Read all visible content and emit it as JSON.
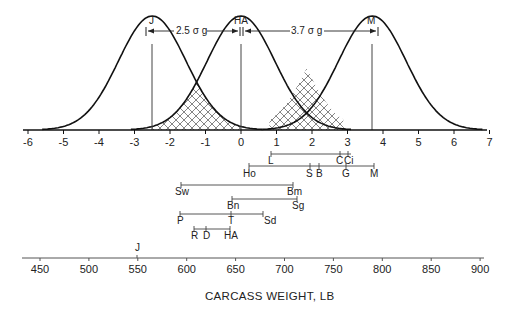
{
  "chart_data": {
    "type": "diagram",
    "title": "",
    "curves": [
      {
        "name": "J",
        "mean_sigma": -2.5,
        "label": "J"
      },
      {
        "name": "HA",
        "mean_sigma": 0,
        "label": "HA"
      },
      {
        "name": "M",
        "mean_sigma": 3.7,
        "label": "M"
      }
    ],
    "distance_annotations": [
      {
        "from": "J",
        "to": "HA",
        "label": "2.5 σ g"
      },
      {
        "from": "HA",
        "to": "M",
        "label": "3.7 σ g"
      }
    ],
    "sigma_axis": {
      "range": [
        -6,
        7
      ],
      "ticks": [
        "-6",
        "-5",
        "-4",
        "-3",
        "-2",
        "-1",
        "0",
        "1",
        "2",
        "3",
        "4",
        "5",
        "6",
        "7"
      ]
    },
    "groups": [
      {
        "line": 1,
        "labels": [
          "L",
          "C",
          "Ci"
        ]
      },
      {
        "line": 2,
        "labels": [
          "Ho",
          "S",
          "B",
          "G",
          "M"
        ]
      },
      {
        "line": 3,
        "labels": [
          "Sw",
          "Bm"
        ]
      },
      {
        "line": 4,
        "labels": [
          "Bn",
          "Sg"
        ]
      },
      {
        "line": 5,
        "labels": [
          "P",
          "T",
          "Sd"
        ]
      },
      {
        "line": 6,
        "labels": [
          "R",
          "D",
          "HA"
        ]
      },
      {
        "line": 7,
        "labels": [
          "J"
        ]
      }
    ],
    "weight_axis": {
      "xlabel": "CARCASS WEIGHT, LB",
      "ticks": [
        "450",
        "500",
        "550",
        "600",
        "650",
        "700",
        "750",
        "800",
        "850",
        "900"
      ]
    }
  },
  "labels": {
    "J_top": "J",
    "HA_top": "HA",
    "M_top": "M",
    "dist1": "2.5 σ g",
    "dist2": "3.7 σ g",
    "caption": "CARCASS WEIGHT, LB"
  },
  "sigma_ticks": [
    "-6",
    "-5",
    "-4",
    "-3",
    "-2",
    "-1",
    "0",
    "1",
    "2",
    "3",
    "4",
    "5",
    "6",
    "7"
  ],
  "weight_ticks": [
    "450",
    "500",
    "550",
    "600",
    "650",
    "700",
    "750",
    "800",
    "850",
    "900"
  ],
  "breeds": {
    "L": "L",
    "C": "C",
    "Ci": "Ci",
    "Ho": "Ho",
    "S": "S",
    "B": "B",
    "G": "G",
    "M": "M",
    "Sw": "Sw",
    "Bm": "Bm",
    "Bn": "Bn",
    "Sg": "Sg",
    "P": "P",
    "T": "T",
    "Sd": "Sd",
    "R": "R",
    "D": "D",
    "HA": "HA",
    "J": "J"
  }
}
